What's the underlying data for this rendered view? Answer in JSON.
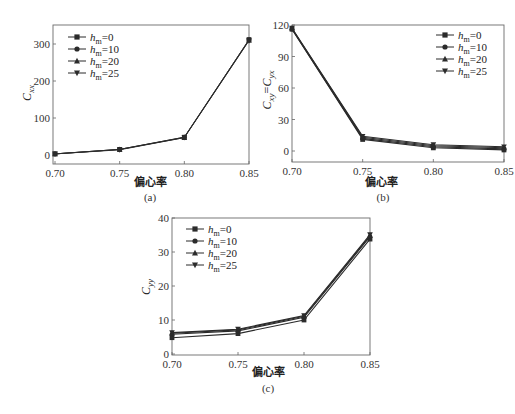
{
  "chart_data": [
    {
      "id": "a",
      "type": "line",
      "caption": "(a)",
      "xlabel": "偏心率",
      "ylabel": "C_xx",
      "ylabel_main": "C",
      "ylabel_sub": "xx",
      "x": [
        0.7,
        0.75,
        0.8,
        0.85
      ],
      "x_ticks": [
        "0.70",
        "0.75",
        "0.80",
        "0.85"
      ],
      "xlim": [
        0.7,
        0.85
      ],
      "y_ticks": [
        0,
        100,
        200,
        300
      ],
      "ylim": [
        -25,
        350
      ],
      "legend_position": "upper-left",
      "series": [
        {
          "name": "h_m=0",
          "marker": "square",
          "values": [
            3,
            15,
            48,
            312
          ]
        },
        {
          "name": "h_m=10",
          "marker": "circle",
          "values": [
            3,
            15,
            48,
            311
          ]
        },
        {
          "name": "h_m=20",
          "marker": "triangle-up",
          "values": [
            3,
            15,
            47,
            310
          ]
        },
        {
          "name": "h_m=25",
          "marker": "triangle-down",
          "values": [
            3,
            14,
            47,
            309
          ]
        }
      ]
    },
    {
      "id": "b",
      "type": "line",
      "caption": "(b)",
      "xlabel": "偏心率",
      "ylabel": "C_xy=C_yx",
      "ylabel_main1": "C",
      "ylabel_sub1": "xy",
      "ylabel_eq": "=",
      "ylabel_main2": "C",
      "ylabel_sub2": "yx",
      "x": [
        0.7,
        0.75,
        0.8,
        0.85
      ],
      "x_ticks": [
        "0.70",
        "0.75",
        "0.80",
        "0.85"
      ],
      "xlim": [
        0.7,
        0.85
      ],
      "y_ticks": [
        0,
        30,
        60,
        90,
        120
      ],
      "ylim": [
        -10,
        120
      ],
      "legend_position": "upper-right",
      "series": [
        {
          "name": "h_m=0",
          "marker": "square",
          "values": [
            116,
            11,
            3,
            1
          ]
        },
        {
          "name": "h_m=10",
          "marker": "circle",
          "values": [
            116,
            12,
            4,
            2
          ]
        },
        {
          "name": "h_m=20",
          "marker": "triangle-up",
          "values": [
            117,
            13,
            5,
            3
          ]
        },
        {
          "name": "h_m=25",
          "marker": "triangle-down",
          "values": [
            117,
            14,
            6,
            4
          ]
        }
      ]
    },
    {
      "id": "c",
      "type": "line",
      "caption": "(c)",
      "xlabel": "偏心率",
      "ylabel": "C_yy",
      "ylabel_main": "C",
      "ylabel_sub": "yy",
      "x": [
        0.7,
        0.75,
        0.8,
        0.85
      ],
      "x_ticks": [
        "0.70",
        "0.75",
        "0.80",
        "0.85"
      ],
      "xlim": [
        0.7,
        0.85
      ],
      "y_ticks": [
        0,
        10,
        20,
        30,
        40
      ],
      "ylim": [
        -1,
        40
      ],
      "legend_position": "upper-left",
      "series": [
        {
          "name": "h_m=0",
          "marker": "square",
          "values": [
            4.8,
            6.0,
            10.0,
            33.8
          ]
        },
        {
          "name": "h_m=10",
          "marker": "circle",
          "values": [
            5.8,
            6.8,
            10.8,
            34.5
          ]
        },
        {
          "name": "h_m=20",
          "marker": "triangle-up",
          "values": [
            6.1,
            7.1,
            11.1,
            34.8
          ]
        },
        {
          "name": "h_m=25",
          "marker": "triangle-down",
          "values": [
            6.3,
            7.3,
            11.3,
            35.1
          ]
        }
      ]
    }
  ],
  "legend": {
    "entries": [
      {
        "main": "h",
        "sub": "m",
        "value": "=0"
      },
      {
        "main": "h",
        "sub": "m",
        "value": "=10"
      },
      {
        "main": "h",
        "sub": "m",
        "value": "=20"
      },
      {
        "main": "h",
        "sub": "m",
        "value": "=25"
      }
    ]
  },
  "colors": {
    "line": "#2b2b2b",
    "axis": "#555555",
    "text": "#333333"
  }
}
